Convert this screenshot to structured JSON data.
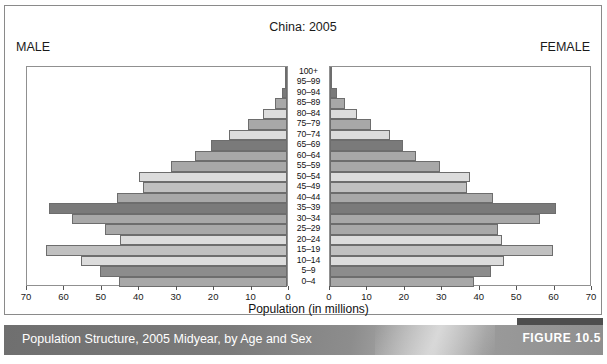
{
  "figure": {
    "title": "China: 2005",
    "male_label": "MALE",
    "female_label": "FEMALE",
    "caption": "Population Structure, 2005 Midyear, by Age and Sex",
    "badge": "FIGURE 10.5"
  },
  "colors": {
    "bar_light": "#dcdcdc",
    "bar_mid": "#c0c0c0",
    "bar_medium": "#a8a8a8",
    "bar_dark": "#8c8c8c",
    "bar_darkest": "#7a7a7a",
    "bar_outline": "#6d6d6d",
    "frame": "#8a8a8a",
    "caption_band_left": "#6f6f6f",
    "caption_band_right": "#8f8f8f",
    "badge": "#4e4e4e",
    "text": "#1a1a1a"
  },
  "chart_data": {
    "type": "bar",
    "subtype": "population-pyramid",
    "title": "China: 2005",
    "xlabel": "Population (in millions)",
    "ylabel": "Age group",
    "xlim": [
      0,
      70
    ],
    "xticks": [
      0,
      10,
      20,
      30,
      40,
      50,
      60,
      70
    ],
    "left_tick_labels": [
      "70",
      "60",
      "50",
      "40",
      "30",
      "20",
      "10",
      "0"
    ],
    "right_tick_labels": [
      "0",
      "10",
      "20",
      "30",
      "40",
      "50",
      "60",
      "70"
    ],
    "grid": false,
    "legend": false,
    "categories": [
      "100+",
      "95–99",
      "90–94",
      "85–89",
      "80–84",
      "75–79",
      "70–74",
      "65–69",
      "60–64",
      "55–59",
      "50–54",
      "45–49",
      "40–44",
      "35–39",
      "30–34",
      "25–29",
      "20–24",
      "15–19",
      "10–14",
      "5–9",
      "0–4"
    ],
    "series": [
      {
        "name": "MALE",
        "side": "left",
        "values": [
          0.1,
          0.4,
          1.3,
          3.2,
          6.3,
          10.5,
          15.5,
          20.2,
          24.5,
          31.0,
          39.5,
          38.5,
          45.5,
          63.5,
          57.5,
          48.5,
          44.5,
          64.5,
          55.0,
          50.0,
          45.0
        ]
      },
      {
        "name": "FEMALE",
        "side": "right",
        "values": [
          0.2,
          0.6,
          1.8,
          4.0,
          7.3,
          11.0,
          16.0,
          19.5,
          23.0,
          29.5,
          37.5,
          36.5,
          43.5,
          60.5,
          56.0,
          45.0,
          46.0,
          59.5,
          46.5,
          43.0,
          38.5
        ]
      }
    ],
    "shades": [
      "bar_dark",
      "bar_medium",
      "bar_darkest",
      "bar_medium",
      "bar_light",
      "bar_medium",
      "bar_light",
      "bar_darkest",
      "bar_medium",
      "bar_medium",
      "bar_light",
      "bar_mid",
      "bar_medium",
      "bar_darkest",
      "bar_medium",
      "bar_medium",
      "bar_light",
      "bar_mid",
      "bar_light",
      "bar_dark",
      "bar_medium"
    ]
  }
}
